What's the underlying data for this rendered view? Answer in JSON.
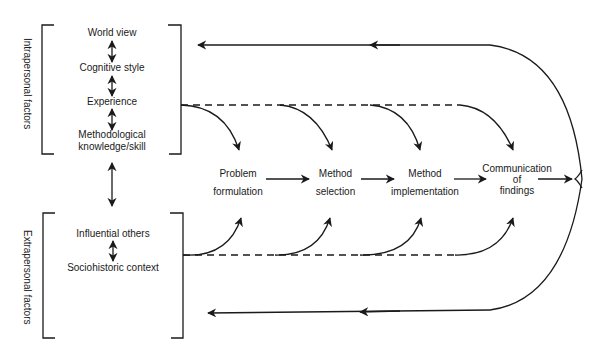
{
  "diagram": {
    "groups": {
      "intrapersonal": {
        "label": "Intrapersonal factors",
        "items": [
          "World view",
          "Cognitive style",
          "Experience",
          "Methodological",
          "knowledge/skill"
        ]
      },
      "extrapersonal": {
        "label": "Extrapersonal factors",
        "items": [
          "Influential others",
          "Sociohistoric context"
        ]
      }
    },
    "stages": [
      {
        "line1": "Problem",
        "line2": "formulation"
      },
      {
        "line1": "Method",
        "line2": "selection"
      },
      {
        "line1": "Method",
        "line2": "implementation"
      },
      {
        "line1": "Communication",
        "line2": "of",
        "line3": "findings"
      }
    ],
    "colors": {
      "stroke": "#1a1a1a",
      "background": "#ffffff"
    }
  }
}
